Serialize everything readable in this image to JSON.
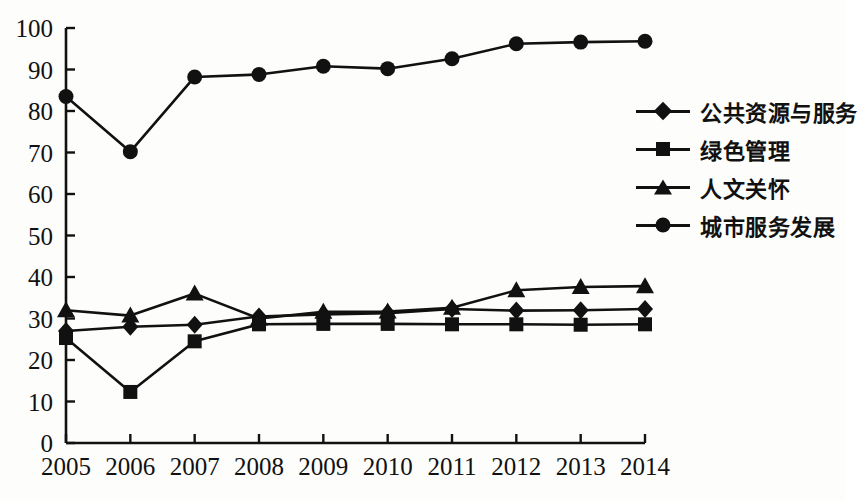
{
  "chart_data": {
    "type": "line",
    "title": "",
    "xlabel": "",
    "ylabel": "",
    "grid": false,
    "legend_position": "right",
    "categories": [
      "2005",
      "2006",
      "2007",
      "2008",
      "2009",
      "2010",
      "2011",
      "2012",
      "2013",
      "2014"
    ],
    "x": [
      2005,
      2006,
      2007,
      2008,
      2009,
      2010,
      2011,
      2012,
      2013,
      2014
    ],
    "ylim": [
      0,
      100
    ],
    "xlim": [
      2005,
      2014
    ],
    "yticks": [
      0,
      10,
      20,
      30,
      40,
      50,
      60,
      70,
      80,
      90,
      100
    ],
    "ytick_labels": [
      "0",
      "10",
      "20",
      "30",
      "40",
      "50",
      "60",
      "70",
      "80",
      "90",
      "100"
    ],
    "series": [
      {
        "name": "公共资源与服务",
        "marker": "diamond",
        "color": "#111111",
        "values": [
          27.0,
          28.0,
          28.5,
          30.5,
          31.0,
          31.3,
          32.3,
          31.9,
          32.0,
          32.3
        ]
      },
      {
        "name": "绿色管理",
        "marker": "square",
        "color": "#111111",
        "values": [
          25.3,
          12.3,
          24.5,
          28.6,
          28.7,
          28.7,
          28.6,
          28.6,
          28.5,
          28.6
        ]
      },
      {
        "name": "人文关怀",
        "marker": "triangle",
        "color": "#111111",
        "values": [
          32.0,
          30.7,
          36.0,
          30.0,
          31.6,
          31.7,
          32.6,
          36.8,
          37.6,
          37.8
        ]
      },
      {
        "name": "城市服务发展",
        "marker": "circle",
        "color": "#111111",
        "values": [
          83.5,
          70.2,
          88.2,
          88.8,
          90.8,
          90.2,
          92.6,
          96.2,
          96.6,
          96.8
        ]
      }
    ]
  },
  "legend": {
    "items": [
      {
        "label": "公共资源与服务",
        "marker": "diamond"
      },
      {
        "label": "绿色管理",
        "marker": "square"
      },
      {
        "label": "人文关怀",
        "marker": "triangle"
      },
      {
        "label": "城市服务发展",
        "marker": "circle"
      }
    ]
  },
  "axis": {
    "line_color": "#111111",
    "tick_color": "#111111"
  }
}
